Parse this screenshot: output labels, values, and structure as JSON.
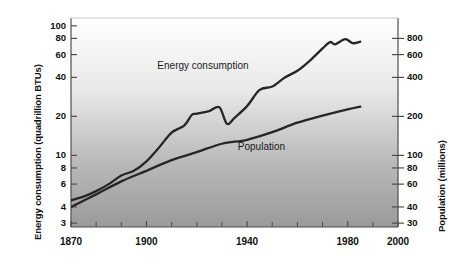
{
  "chart_data": {
    "type": "line",
    "title": "",
    "xlabel": "",
    "ylabel": "Energy consumption (quadrillion BTUs)",
    "y2label": "Population (millions)",
    "xlim": [
      1870,
      2000
    ],
    "xticks": [
      1870,
      1900,
      1940,
      1980,
      2000
    ],
    "xtick_labels": [
      "1870",
      "1900",
      "1940",
      "1980",
      "2000"
    ],
    "xminor_ticks": [
      1880,
      1890,
      1910,
      1920,
      1930,
      1950,
      1960,
      1970,
      1990
    ],
    "yscale": "log",
    "ylim": [
      2.8,
      115
    ],
    "yticks": [
      100,
      80,
      60,
      40,
      20,
      10,
      8,
      6,
      4,
      3
    ],
    "ytick_labels": [
      "100",
      "80",
      "60",
      "40",
      "20",
      "10",
      "8",
      "6",
      "4",
      "3"
    ],
    "y2scale": "log",
    "y2lim": [
      28,
      1150
    ],
    "y2ticks": [
      800,
      600,
      400,
      200,
      100,
      80,
      60,
      40,
      30
    ],
    "y2tick_labels": [
      "800",
      "600",
      "400",
      "200",
      "100",
      "80",
      "60",
      "40",
      "30"
    ],
    "grid": false,
    "legend_position": "inline-annotations",
    "annotations": [
      {
        "text": "Energy consumption",
        "x": 1925,
        "y": 48
      },
      {
        "text": "Population",
        "x": 1957,
        "y": 11.5
      }
    ],
    "series": [
      {
        "name": "Energy consumption",
        "axis": "left",
        "units": "quadrillion BTUs",
        "color": "#262626",
        "x": [
          1870,
          1875,
          1880,
          1885,
          1890,
          1895,
          1900,
          1905,
          1910,
          1915,
          1918,
          1920,
          1925,
          1929,
          1932,
          1935,
          1940,
          1945,
          1950,
          1955,
          1960,
          1965,
          1970,
          1973,
          1975,
          1979,
          1982,
          1985
        ],
        "y": [
          4.5,
          4.8,
          5.3,
          6.0,
          7.0,
          7.6,
          9.0,
          11.5,
          15.0,
          17.0,
          20.5,
          21.0,
          22.0,
          23.5,
          17.5,
          19.5,
          24.0,
          32.0,
          34.0,
          40.0,
          45.0,
          54.0,
          67.0,
          75.0,
          72.0,
          79.0,
          73.5,
          75.5
        ]
      },
      {
        "name": "Population",
        "axis": "right",
        "units": "millions",
        "color": "#262626",
        "x": [
          1870,
          1880,
          1890,
          1900,
          1910,
          1920,
          1930,
          1940,
          1950,
          1960,
          1970,
          1980,
          1985
        ],
        "y": [
          40,
          50,
          63,
          76,
          92,
          106,
          123,
          132,
          151,
          179,
          203,
          227,
          238
        ]
      }
    ]
  },
  "colors": {
    "line": "#262626",
    "plot_bg_top": "#ffffff",
    "plot_bg_bottom": "#9c9c9c",
    "axis": "#4d4d4d",
    "text": "#111111"
  }
}
